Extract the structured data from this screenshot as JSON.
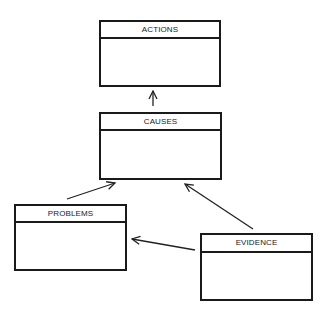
{
  "diagram": {
    "nodes": [
      {
        "id": "actions",
        "label": "ACTIONS"
      },
      {
        "id": "causes",
        "label": "CAUSES"
      },
      {
        "id": "problems",
        "label": "PROBLEMS"
      },
      {
        "id": "evidence",
        "label": "EVIDENCE"
      }
    ],
    "edges": [
      {
        "from": "causes",
        "to": "actions"
      },
      {
        "from": "problems",
        "to": "causes"
      },
      {
        "from": "evidence",
        "to": "causes"
      },
      {
        "from": "evidence",
        "to": "problems"
      }
    ]
  }
}
